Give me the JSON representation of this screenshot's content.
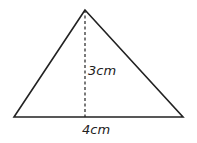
{
  "diagram": {
    "shape": "triangle",
    "height_label": "3cm",
    "base_label": "4cm",
    "apex": [
      85,
      10
    ],
    "base_left": [
      14,
      117
    ],
    "base_right": [
      183,
      117
    ],
    "stroke_color": "#222222"
  }
}
